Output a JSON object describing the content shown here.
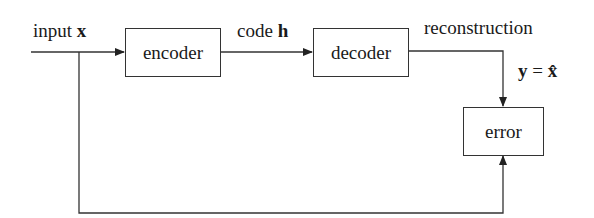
{
  "diagram": {
    "type": "autoencoder-block-diagram",
    "labels": {
      "input_prefix": "input ",
      "input_var": "x",
      "code_prefix": "code ",
      "code_var": "h",
      "reconstruction": "reconstruction",
      "y_var": "y",
      "equals": " = ",
      "xhat": "x̂"
    },
    "blocks": {
      "encoder": "encoder",
      "decoder": "decoder",
      "error": "error"
    },
    "colors": {
      "line": "#333333",
      "text": "#1a1a1a",
      "background": "#ffffff"
    }
  }
}
